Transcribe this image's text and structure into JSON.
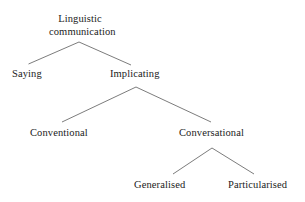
{
  "diagram": {
    "type": "tree",
    "background_color": "#ffffff",
    "line_color": "#5a5a5a",
    "text_color": "#1b1b1b",
    "nodes": {
      "root": {
        "label": "Linguistic communication",
        "line1": "Linguistic",
        "line2": "communication",
        "level": 0
      },
      "saying": {
        "label": "Saying",
        "level": 1
      },
      "implicating": {
        "label": "Implicating",
        "level": 1
      },
      "conventional": {
        "label": "Conventional",
        "level": 2
      },
      "conversational": {
        "label": "Conversational",
        "level": 2
      },
      "generalised": {
        "label": "Generalised",
        "level": 3
      },
      "particularised": {
        "label": "Particularised",
        "level": 3
      }
    },
    "edges": [
      {
        "from": "root",
        "to": "saying"
      },
      {
        "from": "root",
        "to": "implicating"
      },
      {
        "from": "implicating",
        "to": "conventional"
      },
      {
        "from": "implicating",
        "to": "conversational"
      },
      {
        "from": "conversational",
        "to": "generalised"
      },
      {
        "from": "conversational",
        "to": "particularised"
      }
    ]
  }
}
